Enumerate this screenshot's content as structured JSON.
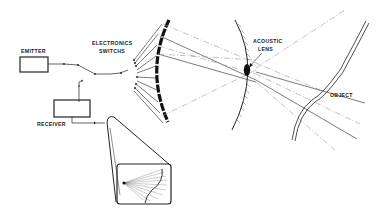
{
  "diagram": {
    "type": "acoustic imaging system schematic",
    "labels": {
      "emitter": "EMITTER",
      "electronics_switches_line1": "ELECTRONICS",
      "electronics_switches_line2": "SWITCHS",
      "receiver": "RECEIVER",
      "acoustic_lens_line1": "ACOUSTIC",
      "acoustic_lens_line2": "LENS",
      "object": "OBJECT"
    },
    "components": [
      {
        "id": "emitter",
        "shape": "rectangle"
      },
      {
        "id": "receiver",
        "shape": "rectangle"
      },
      {
        "id": "electronics-switches",
        "shape": "switch fan-out"
      },
      {
        "id": "transducer-array",
        "shape": "curved segmented arc"
      },
      {
        "id": "acoustic-lens",
        "shape": "ellipse on curved hatched boundary"
      },
      {
        "id": "object",
        "shape": "wavy double-line curve"
      },
      {
        "id": "display",
        "shape": "rounded box with ray image, connected by projection"
      }
    ],
    "colors": {
      "ink": "#222222",
      "dash": "#999999",
      "background": "#ffffff"
    }
  }
}
